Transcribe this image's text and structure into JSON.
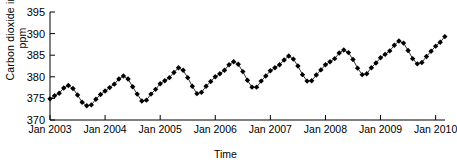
{
  "chart_data": {
    "type": "line",
    "title": "",
    "xlabel": "Time",
    "ylabel": "Carbon dioxide in ppm",
    "ylim": [
      370,
      395
    ],
    "yticks": [
      370,
      375,
      380,
      385,
      390,
      395
    ],
    "xticks": [
      "Jan 2003",
      "Jan 2004",
      "Jan 2005",
      "Jan 2006",
      "Jan 2007",
      "Jan 2008",
      "Jan 2009",
      "Jan 2010"
    ],
    "xlim_years": [
      2003.0,
      2010.17
    ],
    "grid": false,
    "legend": null,
    "marker": "filled-diamond",
    "marker_color": "#000000",
    "line_color": "#000000",
    "x": [
      2003.0,
      2003.083,
      2003.167,
      2003.25,
      2003.333,
      2003.417,
      2003.5,
      2003.583,
      2003.667,
      2003.75,
      2003.833,
      2003.917,
      2004.0,
      2004.083,
      2004.167,
      2004.25,
      2004.333,
      2004.417,
      2004.5,
      2004.583,
      2004.667,
      2004.75,
      2004.833,
      2004.917,
      2005.0,
      2005.083,
      2005.167,
      2005.25,
      2005.333,
      2005.417,
      2005.5,
      2005.583,
      2005.667,
      2005.75,
      2005.833,
      2005.917,
      2006.0,
      2006.083,
      2006.167,
      2006.25,
      2006.333,
      2006.417,
      2006.5,
      2006.583,
      2006.667,
      2006.75,
      2006.833,
      2006.917,
      2007.0,
      2007.083,
      2007.167,
      2007.25,
      2007.333,
      2007.417,
      2007.5,
      2007.583,
      2007.667,
      2007.75,
      2007.833,
      2007.917,
      2008.0,
      2008.083,
      2008.167,
      2008.25,
      2008.333,
      2008.417,
      2008.5,
      2008.583,
      2008.667,
      2008.75,
      2008.833,
      2008.917,
      2009.0,
      2009.083,
      2009.167,
      2009.25,
      2009.333,
      2009.417,
      2009.5,
      2009.583,
      2009.667,
      2009.75,
      2009.833,
      2009.917,
      2010.0,
      2010.083,
      2010.167
    ],
    "values": [
      374.9,
      375.6,
      376.2,
      377.4,
      378.0,
      377.3,
      375.8,
      374.1,
      373.3,
      373.5,
      374.8,
      375.9,
      376.7,
      377.5,
      378.3,
      379.5,
      380.2,
      379.5,
      377.7,
      376.0,
      374.4,
      374.6,
      376.0,
      377.1,
      378.4,
      379.1,
      379.8,
      381.0,
      382.1,
      381.5,
      379.8,
      377.8,
      376.1,
      376.4,
      377.8,
      378.9,
      380.0,
      380.7,
      381.5,
      382.8,
      383.5,
      382.9,
      381.2,
      379.2,
      377.6,
      377.6,
      379.0,
      380.2,
      381.4,
      382.1,
      382.8,
      383.9,
      384.8,
      384.1,
      382.5,
      380.5,
      379.0,
      379.1,
      380.4,
      381.6,
      382.8,
      383.5,
      384.2,
      385.5,
      386.2,
      385.6,
      384.0,
      382.0,
      380.5,
      380.7,
      382.1,
      383.2,
      384.4,
      385.2,
      386.0,
      387.3,
      388.3,
      387.8,
      386.1,
      384.2,
      383.0,
      383.3,
      384.7,
      385.9,
      387.1,
      388.0,
      389.3
    ]
  }
}
